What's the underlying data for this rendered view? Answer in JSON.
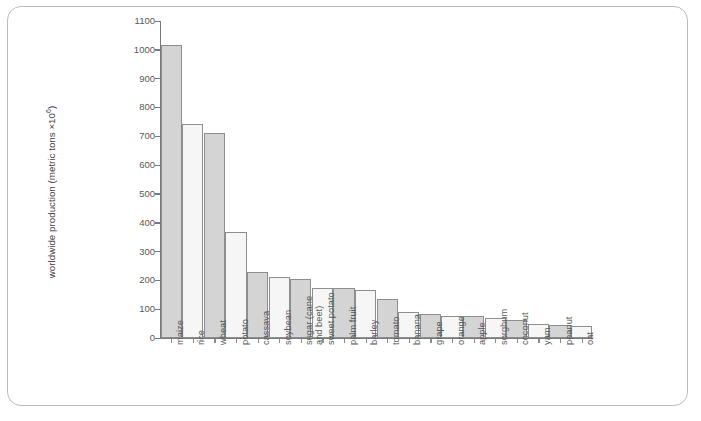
{
  "figure": {
    "frame_border_color": "#b9bcbe",
    "background": "#ffffff"
  },
  "chart_data": {
    "type": "bar",
    "title": "",
    "xlabel": "",
    "ylabel": "worldwide production (metric tons ×10⁶)",
    "ylim": [
      0,
      1100
    ],
    "ytick_step": 100,
    "grid": false,
    "legend": false,
    "bar_colors": [
      "#d4d4d4",
      "#f6f6f6"
    ],
    "bar_edge_color": "#8c8e90",
    "yticks": [
      "0",
      "100",
      "200",
      "300",
      "400",
      "500",
      "600",
      "700",
      "800",
      "900",
      "1000",
      "1100"
    ],
    "categories": [
      "maize",
      "rice",
      "wheat",
      "potato",
      "cassava",
      "soybean",
      "sugar (cane and beet)",
      "sweet potato",
      "palm fruit",
      "barley",
      "tomato",
      "banana",
      "grape",
      "orange",
      "apple",
      "sorghum",
      "coconut",
      "yam",
      "peanut",
      "oat"
    ],
    "values": [
      1015,
      741,
      710,
      368,
      228,
      211,
      205,
      175,
      173,
      165,
      135,
      90,
      83,
      78,
      75,
      70,
      63,
      50,
      45,
      42
    ]
  },
  "axis": {
    "y_title_prefix": "worldwide production (metric tons ×10",
    "y_title_exponent": "6",
    "y_title_suffix": ")"
  }
}
